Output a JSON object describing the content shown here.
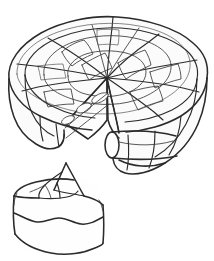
{
  "document": {
    "title": "Cake with Slice Removed",
    "kind": "line-drawing",
    "style": "coloring-book line art, hand-drawn pencil outline",
    "width_px": 214,
    "height_px": 261,
    "background_color": "#ffffff",
    "ink_color": "#2b2b2b",
    "secondary_ink_color": "#55555a",
    "visible_text": "",
    "alt_text": "Hand drawn outline of a round lattice-topped cake with one wedge cut out, and the cut slice resting in front at the lower left."
  },
  "subjects": {
    "whole_cake": {
      "name": "round lattice cake",
      "position": "upper area, spanning nearly full width",
      "bbox": {
        "x": 6,
        "y": 16,
        "w": 202,
        "h": 163
      },
      "parts": {
        "top_surface": "elliptical lattice top with radial spokes meeting at center",
        "lattice_spokes": 12,
        "lattice_rings": 3,
        "outer_wall": "scalloped vertical side wall",
        "cut_wedge_notch": "V-shaped notch removed from lower-left-of-center",
        "cut_face_left": "flat vertical cut face on the left of the notch",
        "cut_face_right": "flat vertical cut face on the right of the notch, with rolled cylinder end",
        "filling_ovals": 3
      }
    },
    "cut_slice": {
      "name": "single cake slice",
      "position": "lower left, in front of the cake",
      "bbox": {
        "x": 12,
        "y": 160,
        "w": 100,
        "h": 96
      },
      "parts": {
        "pointed_top": "triangular peaked tip pointing up-right",
        "lattice_facets": 4,
        "front_face": "broad front face of the wedge",
        "frosting_drip": "wavy horizontal frosting line across the front face",
        "base": "rounded base edge"
      }
    }
  },
  "palette": {
    "paper": "#ffffff",
    "outline": "#2b2b2b",
    "outline_light": "#55555a",
    "fill_paper": "#fefefe",
    "fill_shade": "#fbfbfb"
  }
}
